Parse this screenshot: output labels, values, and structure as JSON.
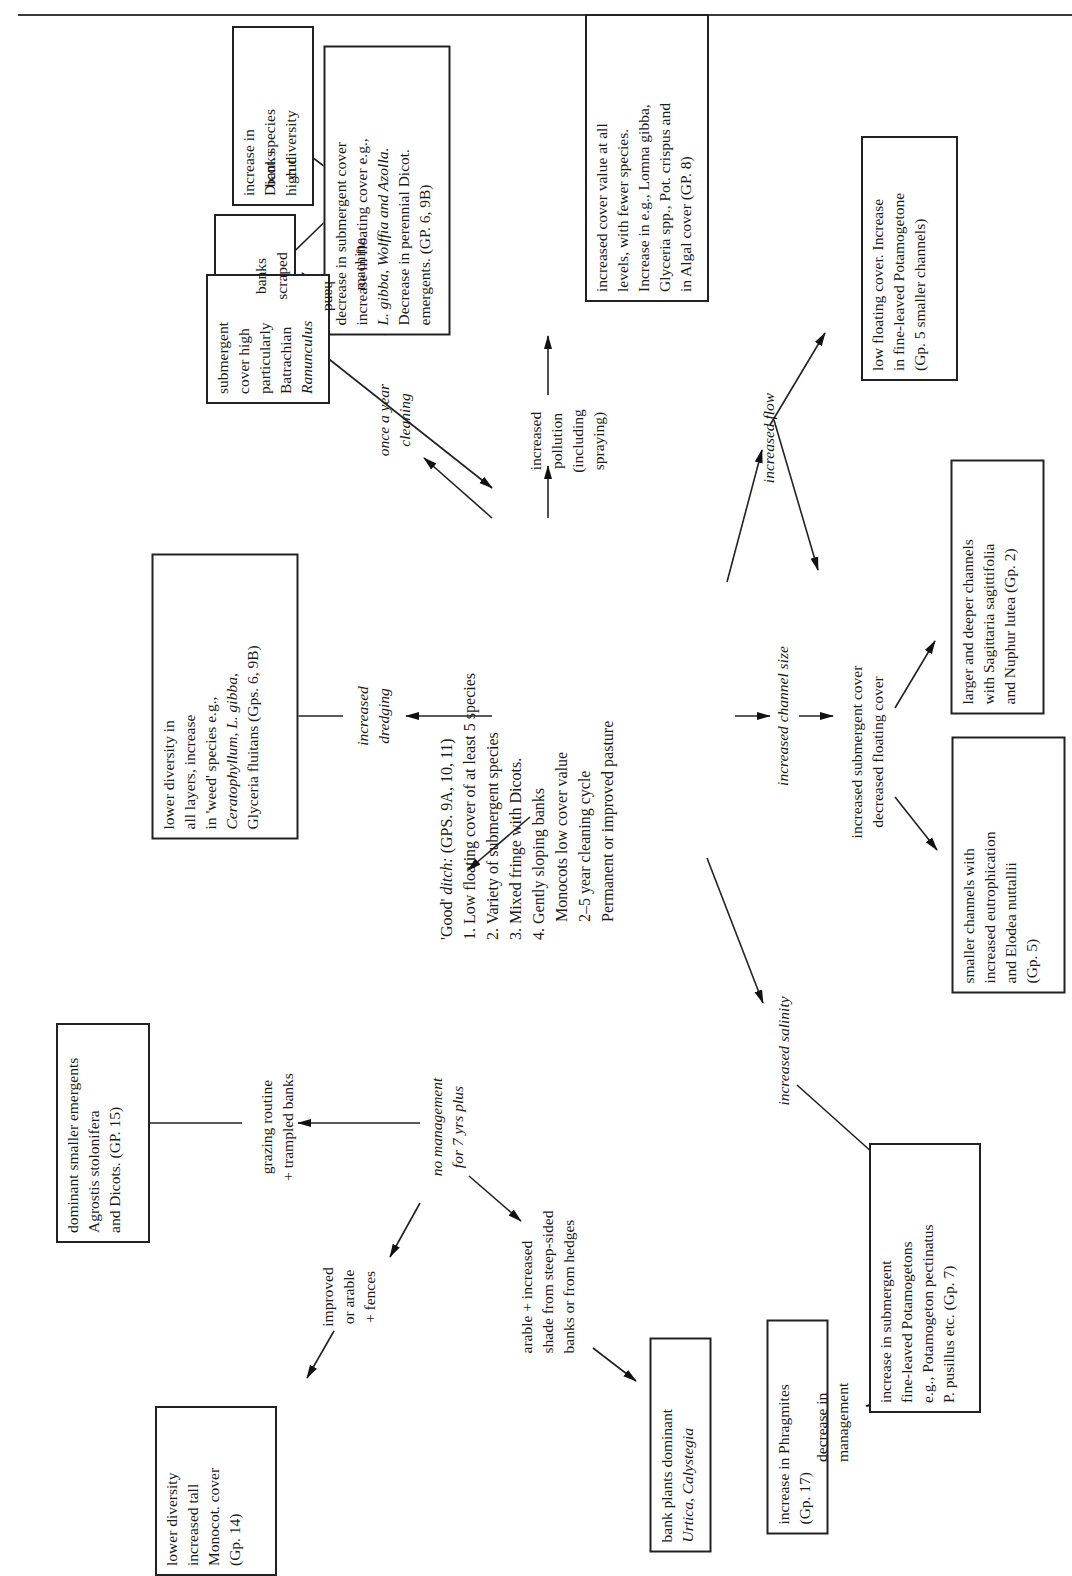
{
  "center": {
    "title_prefix": "'Good' ",
    "title_italic": "ditch:",
    "title_groups": " (GPS. 9A, 10, 11)",
    "lines": [
      "1. Low floating cover of at least 5 species",
      "2. Variety of submergent species",
      "3. Mixed fringe with Dicots.",
      "4. Gently sloping banks",
      "    Monocots low cover value",
      "    2–5 year cleaning cycle",
      "    Permanent or improved pasture"
    ]
  },
  "labels": {
    "once_a_year_cleaning": [
      "once a year",
      "cleaning"
    ],
    "hand": "hand",
    "machine": "machine",
    "banks_cut": [
      "banks",
      "cut"
    ],
    "banks_scraped": [
      "banks",
      "scraped"
    ],
    "increased_pollution": [
      "increased",
      "pollution",
      "(including",
      "spraying)"
    ],
    "increased_flow": "increased flow",
    "increased_dredging": [
      "increased",
      "dredging"
    ],
    "increased_channel_size": "increased channel size",
    "increased_submergent": [
      "increased submergent cover",
      "decreased floating cover"
    ],
    "increased_salinity": "increased salinity",
    "no_management": [
      "no management",
      "for 7 yrs plus"
    ],
    "grazing": [
      "grazing routine",
      "+ trampled banks"
    ],
    "improved_arable": [
      "improved",
      "or arable",
      "+ fences"
    ],
    "arable_shade": [
      "arable + increased",
      "shade from steep-sided",
      "banks or from hedges"
    ],
    "decrease_management": [
      "decrease in",
      "management"
    ]
  },
  "boxes": {
    "dicot_increase": [
      "increase in",
      "Dicot. species",
      "high diversity"
    ],
    "monocot_increase": [
      "increase in",
      "monocot. species",
      "low diversity"
    ],
    "machine_result": [
      "decrease in submergent cover",
      "increase in floating cover e.g.,",
      "L. gibba, Wolffia and Azolla.",
      "Decrease in perennial Dicot.",
      "emergents. (GP. 6, 9B)"
    ],
    "hand_result": [
      "submergent",
      "cover high",
      "particularly",
      "Batrachian",
      "Ranunculus"
    ],
    "pollution_result": [
      "increased cover value at all",
      "levels, with fewer species.",
      "Increase in e.g., Lomna gibba,",
      "Glyceria spp., Pot. crispus and",
      "in Algal cover (GP. 8)"
    ],
    "flow_result": [
      "low floating cover. Increase",
      "in fine-leaved Potamogetone",
      "(Gp. 5 smaller channels)"
    ],
    "dredging_result": [
      "lower diversity in",
      "all layers, increase",
      "in 'weed' species e.g.,",
      "Ceratophyllum, L. gibba,",
      "Glyceria fluitans (Gps. 6, 9B)"
    ],
    "larger_channels": [
      "larger and deeper channels",
      "with Sagittaria sagittifolia",
      "and Nuphur lutea (Gp. 2)"
    ],
    "smaller_channels": [
      "smaller channels with",
      "increased eutrophication",
      "and Elodea nuttallii",
      "(Gp. 5)"
    ],
    "grazing_result": [
      "dominant smaller emergents",
      "Agrostis stolonifera",
      "and Dicots. (GP. 15)"
    ],
    "improved_result": [
      "lower diversity",
      "increased tall",
      "Monocot. cover",
      "(Gp. 14)"
    ],
    "bank_plants": [
      "bank plants dominant",
      "Urtica, Calystegia"
    ],
    "phragmites": [
      "increase in Phragmites",
      "(Gp. 17)"
    ],
    "salinity_result": [
      "increase in submergent",
      "fine-leaved Potamogetons",
      "e.g., Potamogeton pectinatus",
      "P. pusillus etc. (Gp. 7)"
    ]
  }
}
